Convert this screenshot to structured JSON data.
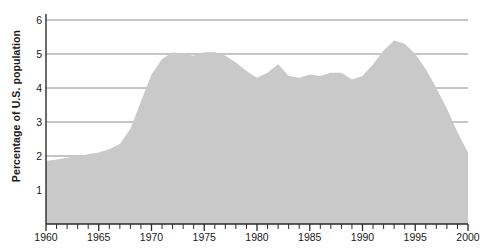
{
  "chart_data": {
    "type": "area",
    "title": "",
    "subtitle": "",
    "xlabel": "",
    "ylabel": "Percentage of U.S. population",
    "xlim": [
      1960,
      2000
    ],
    "ylim": [
      0,
      6
    ],
    "grid": true,
    "legend": null,
    "series_name": "Percentage of U.S. population",
    "fill_color": "#c9c9c9",
    "grid_color": "#8c8c8c",
    "axis_color": "#2b2b2b",
    "text_color": "#1a1a1a",
    "background_color": "#ffffff",
    "y_ticks": [
      1,
      2,
      3,
      4,
      5,
      6
    ],
    "y_tick_labels": [
      "1",
      "2",
      "3",
      "4",
      "5",
      "6"
    ],
    "x_ticks_major": [
      1960,
      1965,
      1970,
      1975,
      1980,
      1985,
      1990,
      1995,
      2000
    ],
    "x_tick_labels": [
      "1960",
      "1965",
      "1970",
      "1975",
      "1980",
      "1985",
      "1990",
      "1995",
      "2000"
    ],
    "x_minor_tick_interval": 1,
    "x": [
      1960,
      1961,
      1962,
      1963,
      1964,
      1965,
      1966,
      1967,
      1968,
      1969,
      1970,
      1971,
      1972,
      1973,
      1974,
      1975,
      1976,
      1977,
      1978,
      1979,
      1980,
      1981,
      1982,
      1983,
      1984,
      1985,
      1986,
      1987,
      1988,
      1989,
      1990,
      1991,
      1992,
      1993,
      1994,
      1995,
      1996,
      1997,
      1998,
      1999,
      2000
    ],
    "values": [
      1.85,
      1.9,
      1.95,
      2.0,
      2.05,
      2.1,
      2.2,
      2.35,
      2.8,
      3.6,
      4.4,
      4.85,
      5.05,
      5.0,
      4.95,
      5.05,
      5.05,
      4.95,
      4.75,
      4.5,
      4.3,
      4.45,
      4.7,
      4.35,
      4.3,
      4.4,
      4.35,
      4.45,
      4.45,
      4.25,
      4.35,
      4.7,
      5.1,
      5.4,
      5.3,
      5.0,
      4.55,
      4.0,
      3.4,
      2.7,
      2.1
    ]
  }
}
